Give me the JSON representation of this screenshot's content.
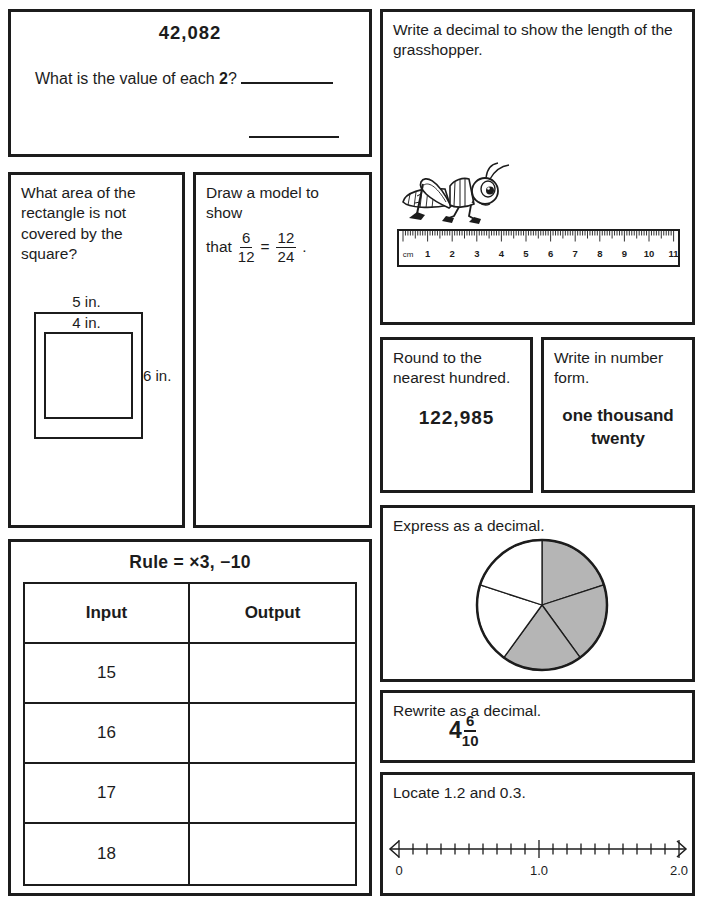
{
  "colors": {
    "ink": "#1c1c1c",
    "pie_shaded": "#b5b5b5",
    "paper": "#ffffff"
  },
  "boxes": {
    "place_value": {
      "number": "42,082",
      "question_before": "What is the value of each ",
      "question_bold_digit": "2",
      "question_after": "? "
    },
    "area": {
      "question": "What area of the rectangle is not covered by the square?",
      "outer_top_label": "5 in.",
      "inner_top_label": "4 in.",
      "outer_side_label": "6 in."
    },
    "model": {
      "line1": "Draw a model to show",
      "line2_prefix": "that",
      "fraction1": {
        "numerator": "6",
        "denominator": "12"
      },
      "equals": "=",
      "fraction2": {
        "numerator": "12",
        "denominator": "24"
      },
      "period": "."
    },
    "grasshopper": {
      "prompt": "Write a decimal to show the length of the grasshopper.",
      "ruler_unit": "cm",
      "ruler_numbers": [
        "1",
        "2",
        "3",
        "4",
        "5",
        "6",
        "7",
        "8",
        "9",
        "10",
        "11"
      ]
    },
    "round": {
      "prompt": "Round to the nearest hundred.",
      "number": "122,985"
    },
    "number_form": {
      "prompt": "Write in number form.",
      "words": "one thousand twenty"
    },
    "pie": {
      "prompt": "Express as a decimal.",
      "total_slices": 5,
      "shaded_slices": 3
    },
    "rewrite": {
      "prompt": "Rewrite as a decimal.",
      "whole": "4",
      "fraction": {
        "numerator": "6",
        "denominator": "10"
      }
    },
    "number_line": {
      "prompt": "Locate 1.2 and 0.3.",
      "tick_start": 0,
      "tick_end": 2.0,
      "tick_step": 0.1,
      "labels": [
        {
          "value": "0",
          "position": 0
        },
        {
          "value": "1.0",
          "position": 10
        },
        {
          "value": "2.0",
          "position": 20
        }
      ]
    },
    "io_table": {
      "title": "Rule = ×3, −10",
      "headers": [
        "Input",
        "Output"
      ],
      "rows": [
        {
          "input": "15",
          "output": ""
        },
        {
          "input": "16",
          "output": ""
        },
        {
          "input": "17",
          "output": ""
        },
        {
          "input": "18",
          "output": ""
        }
      ]
    }
  }
}
